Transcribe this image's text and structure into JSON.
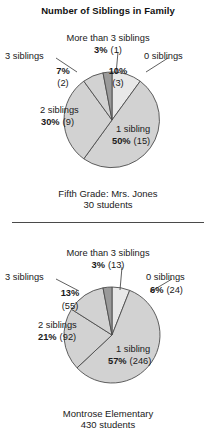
{
  "title": "Number of Siblings in Family",
  "divider": {
    "name": "section-divider"
  },
  "charts": [
    {
      "id": "fifth-grade",
      "caption_line1": "Fifth Grade: Mrs. Jones",
      "caption_line2": "30 students",
      "labels": {
        "more_than_3": "More than 3 siblings",
        "more_than_3_value": "3%",
        "more_than_3_count": "(1)",
        "three": "3 siblings",
        "three_value": "7%",
        "three_count": "(2)",
        "zero": "0 siblings",
        "zero_value": "10%",
        "zero_count": "(3)",
        "two": "2 siblings",
        "two_value": "30%",
        "two_count": "(9)",
        "one": "1 sibling",
        "one_value": "50%",
        "one_count": "(15)"
      }
    },
    {
      "id": "montrose-elementary",
      "caption_line1": "Montrose Elementary",
      "caption_line2": "430 students",
      "labels": {
        "more_than_3": "More than 3 siblings",
        "more_than_3_value": "3%",
        "more_than_3_count": "(13)",
        "three": "3 siblings",
        "three_value": "13%",
        "three_count": "(55)",
        "zero": "0 siblings",
        "zero_value": "6%",
        "zero_count": "(24)",
        "two": "2 siblings",
        "two_value": "21%",
        "two_count": "(92)",
        "one": "1 sibling",
        "one_value": "57%",
        "one_count": "(246)"
      }
    }
  ],
  "colors": {
    "slice_light": "#e8e8e8",
    "slice_mid": "#d2d2d2",
    "slice_dark": "#9a9a9a",
    "outline": "#4d4d4d",
    "text": "#1a1a1a",
    "background": "#ffffff"
  },
  "chart_data": [
    {
      "type": "pie",
      "title": "Number of Siblings in Family",
      "subtitle": "Fifth Grade: Mrs. Jones",
      "total_label": "30 students",
      "total": 30,
      "categories": [
        "0 siblings",
        "1 sibling",
        "2 siblings",
        "3 siblings",
        "More than 3 siblings"
      ],
      "values": [
        10,
        50,
        30,
        7,
        3
      ],
      "counts": [
        3,
        15,
        9,
        2,
        1
      ],
      "value_unit": "percent",
      "legend": "inline-labels",
      "grid": false,
      "start_angle_deg": 0,
      "direction": "clockwise",
      "slice_colors": [
        "#e8e8e8",
        "#d2d2d2",
        "#d2d2d2",
        "#d2d2d2",
        "#9a9a9a"
      ]
    },
    {
      "type": "pie",
      "title": "Number of Siblings in Family",
      "subtitle": "Montrose Elementary",
      "total_label": "430 students",
      "total": 430,
      "categories": [
        "0 siblings",
        "1 sibling",
        "2 siblings",
        "3 siblings",
        "More than 3 siblings"
      ],
      "values": [
        6,
        57,
        21,
        13,
        3
      ],
      "counts": [
        24,
        246,
        92,
        55,
        13
      ],
      "value_unit": "percent",
      "legend": "inline-labels",
      "grid": false,
      "start_angle_deg": 0,
      "direction": "clockwise",
      "slice_colors": [
        "#e8e8e8",
        "#d2d2d2",
        "#d2d2d2",
        "#d2d2d2",
        "#9a9a9a"
      ]
    }
  ]
}
